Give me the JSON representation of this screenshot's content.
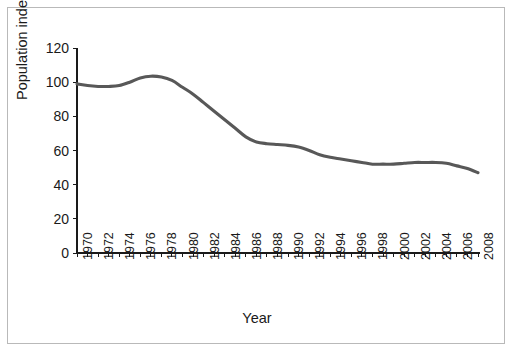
{
  "chart_data": {
    "type": "line",
    "title": "",
    "xlabel": "Year",
    "ylabel": "Population index",
    "xlim": [
      1970,
      2008
    ],
    "ylim": [
      0,
      120
    ],
    "grid": false,
    "legend": "none",
    "line_color": "#585858",
    "axis_color": "#1a1a1a",
    "ytick_labels": [
      "120",
      "100",
      "80",
      "60",
      "40",
      "20",
      "0"
    ],
    "yticks": [
      120,
      100,
      80,
      60,
      40,
      20,
      0
    ],
    "xtick_labels": [
      "1970",
      "1972",
      "1974",
      "1976",
      "1978",
      "1980",
      "1982",
      "1984",
      "1986",
      "1988",
      "1990",
      "1992",
      "1994",
      "1996",
      "1998",
      "2000",
      "2002",
      "2004",
      "2006",
      "2008"
    ],
    "xticks": [
      1970,
      1972,
      1974,
      1976,
      1978,
      1980,
      1982,
      1984,
      1986,
      1988,
      1990,
      1992,
      1994,
      1996,
      1998,
      2000,
      2002,
      2004,
      2006,
      2008
    ],
    "minor_xticks_every": 1,
    "x": [
      1970,
      1971,
      1972,
      1973,
      1974,
      1975,
      1976,
      1977,
      1978,
      1979,
      1980,
      1981,
      1982,
      1983,
      1984,
      1985,
      1986,
      1987,
      1988,
      1989,
      1990,
      1991,
      1992,
      1993,
      1994,
      1995,
      1996,
      1997,
      1998,
      1999,
      2000,
      2001,
      2002,
      2003,
      2004,
      2005,
      2006,
      2007,
      2008
    ],
    "values": [
      99,
      98,
      97.5,
      97.5,
      98,
      100,
      102.5,
      103.5,
      103,
      101,
      97,
      93,
      88,
      83,
      78,
      73,
      68,
      65,
      64,
      63.5,
      63,
      62,
      60,
      57.5,
      56,
      55,
      54,
      53,
      52,
      52,
      52,
      52.5,
      53,
      53,
      53,
      52.5,
      51,
      49.5,
      47
    ],
    "series_name": "Population index"
  },
  "axis_labels": {
    "x": "Year",
    "y": "Population index"
  }
}
